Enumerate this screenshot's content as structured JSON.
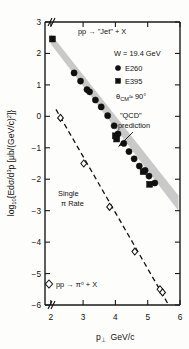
{
  "chart_data": {
    "type": "scatter",
    "title": "",
    "xlabel": "p⊥  GeV/c",
    "ylabel": "log₁₀{Edσ/d³p [μb/(GeV/c)²]}",
    "xlim": [
      1.82,
      6.0
    ],
    "ylim": [
      -6,
      3
    ],
    "xticks": [
      2,
      3,
      4,
      5,
      6
    ],
    "yticks": [
      3,
      2,
      1,
      0,
      -1,
      -2,
      -3,
      -4,
      -5,
      -6
    ],
    "xticklabels": [
      "2",
      "3",
      "4",
      "5",
      "6"
    ],
    "yticklabels": [
      "3",
      "2",
      "1",
      "0",
      "−1",
      "−2",
      "−3",
      "−4",
      "−5",
      "−6"
    ],
    "grid": false,
    "axis_break": true,
    "legend_position": "upper-right",
    "series": [
      {
        "name": "E260",
        "marker": "filled-circle",
        "points": [
          [
            2.72,
            1.38
          ],
          [
            2.92,
            1.12
          ],
          [
            3.12,
            0.85
          ],
          [
            3.2,
            0.78
          ],
          [
            3.38,
            0.52
          ],
          [
            3.56,
            0.3
          ],
          [
            3.76,
            0.02
          ],
          [
            3.96,
            -0.3
          ],
          [
            4.08,
            -0.56
          ],
          [
            4.26,
            -0.86
          ],
          [
            4.42,
            -1.12
          ],
          [
            4.58,
            -1.35
          ],
          [
            4.74,
            -1.58
          ],
          [
            4.92,
            -1.72
          ],
          [
            5.04,
            -1.9
          ],
          [
            5.22,
            -2.12
          ]
        ]
      },
      {
        "name": "E395",
        "marker": "filled-square",
        "points": [
          [
            2.05,
            2.46
          ],
          [
            4.0,
            -0.62
          ],
          [
            4.04,
            -0.72
          ],
          [
            4.86,
            -1.76
          ],
          [
            5.06,
            -2.16
          ]
        ]
      },
      {
        "name": "pp → π⁰ + X",
        "marker": "open-diamond",
        "points": [
          [
            2.3,
            -0.05
          ],
          [
            3.02,
            -1.5
          ],
          [
            3.82,
            -2.88
          ],
          [
            4.6,
            -4.3
          ],
          [
            5.38,
            -5.5
          ],
          [
            5.46,
            -5.6
          ]
        ]
      }
    ],
    "band": {
      "name": "\"QCD\" prediction",
      "x_start": 2.0,
      "x_end": 5.95,
      "y_upper_start": 2.62,
      "y_upper_end": -2.52,
      "y_lower_start": 2.3,
      "y_lower_end": -3.0,
      "color": "#c4c4c4"
    },
    "dashed_line": {
      "name": "Single π Rate",
      "x_start": 2.16,
      "y_start": 0.22,
      "x_end": 5.62,
      "y_end": -5.95
    }
  },
  "annotations": {
    "reaction": "pp → \"Jet\" + X",
    "energy": "W = 19.4 GeV",
    "legend_e260": "E260",
    "legend_e395": "E395",
    "angle_prefix": "θ",
    "angle_sub": "CM",
    "angle_value": "≈ 90°",
    "qcd_line1": "\"QCD\"",
    "qcd_line2": "prediction",
    "single_line1": "Single",
    "single_line2": "π Rate",
    "pion_legend": "pp → π⁰ + X"
  },
  "axis": {
    "xlabel_main": "p",
    "xlabel_sub": "⊥",
    "xlabel_unit": "GeV/c",
    "ylabel_full": "log₁₀{Edσ/d³p [μb/(GeV/c)²]}"
  },
  "colors": {
    "band": "#c4c4c4",
    "marker": "#101010",
    "axis": "#1a1a1a",
    "background": "#fdfdfb"
  }
}
